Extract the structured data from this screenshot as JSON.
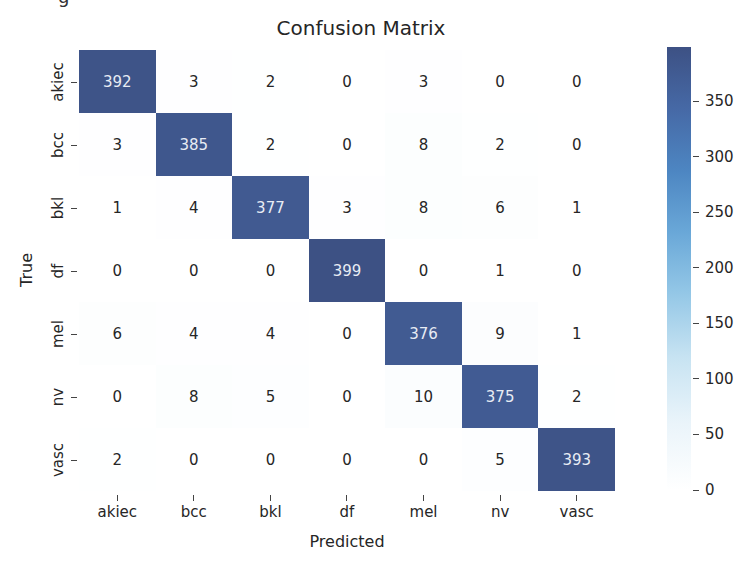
{
  "chart_data": {
    "type": "heatmap",
    "title": "Confusion Matrix",
    "xlabel": "Predicted",
    "ylabel": "True",
    "x_categories": [
      "akiec",
      "bcc",
      "bkl",
      "df",
      "mel",
      "nv",
      "vasc"
    ],
    "y_categories": [
      "akiec",
      "bcc",
      "bkl",
      "df",
      "mel",
      "nv",
      "vasc"
    ],
    "matrix": [
      [
        392,
        3,
        2,
        0,
        3,
        0,
        0
      ],
      [
        3,
        385,
        2,
        0,
        8,
        2,
        0
      ],
      [
        1,
        4,
        377,
        3,
        8,
        6,
        1
      ],
      [
        0,
        0,
        0,
        399,
        0,
        1,
        0
      ],
      [
        6,
        4,
        4,
        0,
        376,
        9,
        1
      ],
      [
        0,
        8,
        5,
        0,
        10,
        375,
        2
      ],
      [
        2,
        0,
        0,
        0,
        0,
        5,
        393
      ]
    ],
    "colorbar": {
      "ticks": [
        0,
        50,
        100,
        150,
        200,
        250,
        300,
        350
      ],
      "range": [
        0,
        399
      ],
      "colormap": "white-to-blue"
    },
    "colors": {
      "low": "#ffffff",
      "mid": "#6aa8d8",
      "high": "#3d5184",
      "text_dark": "#262626",
      "text_light": "#e8ecf4"
    }
  },
  "page": {
    "fragment_text": "g"
  }
}
